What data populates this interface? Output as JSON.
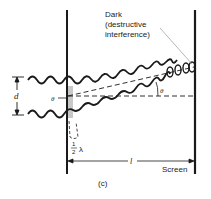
{
  "figure": {
    "caption": "(c)",
    "annotation_line1": "Dark",
    "annotation_line2": "(destructive",
    "annotation_line3": "interference)",
    "screen_label": "Screen",
    "slit_separation_label": "d",
    "angle_label_left": "θ",
    "angle_label_right": "θ",
    "path_difference_num": "1",
    "path_difference_den": "2",
    "path_difference_symbol": "λ",
    "distance_label": "l"
  },
  "colors": {
    "ink": "#1a1a1a",
    "shade": "#c8c8c8",
    "leader": "#9a9a9a",
    "background": "#ffffff"
  }
}
